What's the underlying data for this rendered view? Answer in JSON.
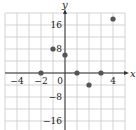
{
  "chart_data": {
    "type": "scatter",
    "title": "",
    "xlabel": "x",
    "ylabel": "y",
    "xlim": [
      -5,
      5
    ],
    "ylim": [
      -19,
      20
    ],
    "grid": true,
    "x_ticks": [
      -4,
      -2,
      0,
      4
    ],
    "x_tick_labels": [
      "−4",
      "−2",
      "0",
      "4"
    ],
    "y_ticks": [
      16,
      8,
      -8,
      -16
    ],
    "y_tick_labels": [
      "16",
      "8",
      "−8",
      "−16"
    ],
    "x_grid_step": 1,
    "y_grid_step": 4,
    "points": [
      {
        "x": -2,
        "y": 0
      },
      {
        "x": -1,
        "y": 8
      },
      {
        "x": 0,
        "y": 6
      },
      {
        "x": 1,
        "y": 0
      },
      {
        "x": 2,
        "y": -4
      },
      {
        "x": 3,
        "y": 0
      },
      {
        "x": 4,
        "y": 18
      }
    ],
    "colors": {
      "grid": "#c8c8c8",
      "axis": "#333333",
      "point": "#555555"
    }
  }
}
